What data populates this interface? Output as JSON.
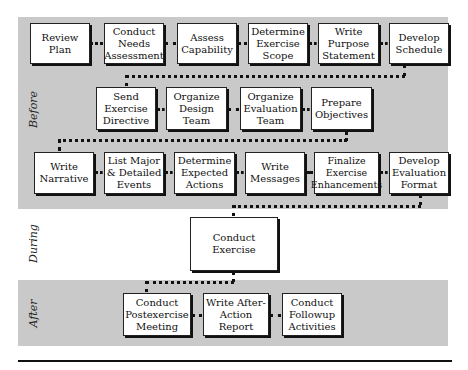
{
  "phases": {
    "before": "Before",
    "during": "During",
    "after": "After"
  },
  "before_row1": [
    "Review Plan",
    "Conduct Needs Assessment",
    "Assess Capability",
    "Determine Exercise Scope",
    "Write Purpose Statement",
    "Develop Schedule"
  ],
  "before_row2": [
    "Send Exercise Directive",
    "Organize Design Team",
    "Organize Evaluation Team",
    "Prepare Objectives"
  ],
  "before_row3": [
    "Write Narrative",
    "List Major & Detailed Events",
    "Determine Expected Actions",
    "Write Messages",
    "Finalize Exercise Enhancements",
    "Develop Evaluation Format"
  ],
  "during": [
    "Conduct Exercise"
  ],
  "after": [
    "Conduct Postexercise Meeting",
    "Write After-Action Report",
    "Conduct Followup Activities"
  ],
  "colors": {
    "band": "#c9c9c9",
    "box_fill": "#ffffff",
    "border": "#222222"
  }
}
